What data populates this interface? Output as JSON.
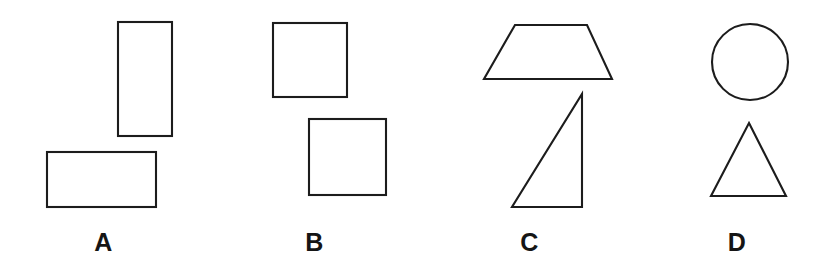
{
  "figure": {
    "background_color": "#ffffff",
    "stroke_color": "#1c1c1c",
    "fill_color": "#ffffff",
    "width": 837,
    "height": 278
  },
  "panels": [
    {
      "id": "a",
      "label": "A",
      "label_center_x": 103,
      "shapes": [
        {
          "name": "tall-rectangle",
          "type": "rectangle",
          "x": 118,
          "y": 22,
          "width": 54,
          "height": 114,
          "orientation": "portrait"
        },
        {
          "name": "wide-rectangle",
          "type": "rectangle",
          "x": 47,
          "y": 152,
          "width": 109,
          "height": 55,
          "orientation": "landscape"
        }
      ]
    },
    {
      "id": "b",
      "label": "B",
      "label_center_x": 326,
      "shapes": [
        {
          "name": "upper-square",
          "type": "square",
          "x": 273,
          "y": 23,
          "width": 74,
          "height": 74,
          "orientation": "upright"
        },
        {
          "name": "lower-square",
          "type": "square",
          "x": 309,
          "y": 119,
          "width": 77,
          "height": 76,
          "orientation": "upright"
        }
      ]
    },
    {
      "id": "c",
      "label": "C",
      "label_center_x": 545,
      "shapes": [
        {
          "name": "trapezoid",
          "type": "trapezoid",
          "points": "515,25 587,25 612,79 484,79",
          "orientation": "wide-base-down"
        },
        {
          "name": "right-triangle",
          "type": "right-triangle",
          "points": "582,94 582,207 512,207",
          "orientation": "right-angle-bottom-right"
        }
      ]
    },
    {
      "id": "d",
      "label": "D",
      "label_center_x": 748,
      "shapes": [
        {
          "name": "circle",
          "type": "ellipse",
          "cx": 750,
          "cy": 62,
          "rx": 38,
          "ry": 38,
          "orientation": "none"
        },
        {
          "name": "isosceles-triangle",
          "type": "triangle",
          "points": "749,123 786,196 711,196",
          "orientation": "apex-up"
        }
      ]
    }
  ]
}
